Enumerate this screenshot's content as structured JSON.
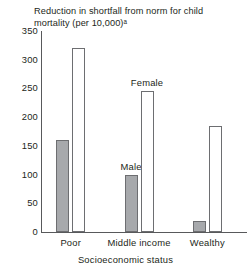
{
  "chart_data": {
    "type": "bar",
    "title": "Reduction in shortfall from norm for child\nmortality (per 10,000)ᵃ",
    "xlabel": "Socioeconomic status",
    "ylabel": "",
    "categories": [
      "Poor",
      "Middle income",
      "Wealthy"
    ],
    "series": [
      {
        "name": "Male",
        "values": [
          160,
          100,
          20
        ],
        "color": "#a7a9ac"
      },
      {
        "name": "Female",
        "values": [
          320,
          245,
          185
        ],
        "color": "#ffffff"
      }
    ],
    "ylim": [
      0,
      350
    ],
    "yticks": [
      0,
      50,
      100,
      150,
      200,
      250,
      300,
      350
    ],
    "ytick_labels": [
      "0",
      "50",
      "100",
      "150",
      "200",
      "250",
      "300",
      "350"
    ],
    "grid": false,
    "legend": "inline-annotations",
    "annotations": [
      {
        "text": "Female",
        "series": "Female",
        "category": "Middle income"
      },
      {
        "text": "Male",
        "series": "Male",
        "category": "Middle income"
      }
    ],
    "footnote_marker": "a"
  },
  "colors": {
    "axis": "#58595b",
    "bar_outline": "#6d6e71",
    "male_fill": "#a7a9ac",
    "female_fill": "#ffffff",
    "text": "#231f20",
    "background": "#ffffff"
  }
}
